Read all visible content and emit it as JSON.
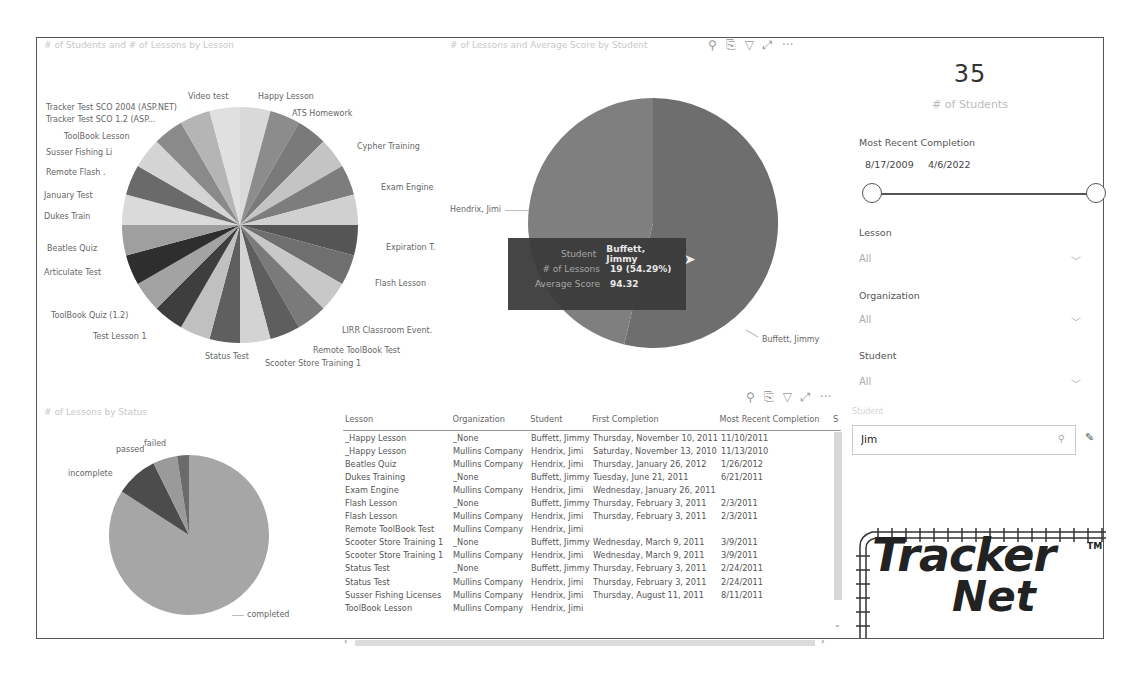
{
  "visuals": {
    "pie_lessons": {
      "title": "# of Students and # of Lessons by Lesson",
      "labels": [
        "Video test",
        "Happy Lesson",
        "ATS Homework",
        "Cypher Training",
        "Exam Engine",
        "Expiration T.",
        "Flash Lesson",
        "LIRR Classroom Event.",
        "Remote ToolBook Test",
        "Scooter Store Training 1",
        "Status Test",
        "Test Lesson 1",
        "ToolBook Quiz (1.2)",
        "Articulate Test",
        "Beatles Quiz",
        "Dukes Train",
        "January Test",
        "Remote Flash .",
        "Susser Fishing Li",
        "ToolBook Lesson",
        "Tracker Test SCO 1.2 (ASP...",
        "Tracker Test SCO 2004 (ASP.NET)"
      ]
    },
    "pie_students": {
      "title": "# of Lessons and Average Score by Student",
      "labels": [
        "Hendrix, Jimi",
        "Buffett, Jimmy"
      ]
    },
    "pie_status": {
      "title": "# of Lessons by Status",
      "labels": [
        "failed",
        "passed",
        "incomplete",
        "completed"
      ]
    },
    "tooltip": {
      "rows": [
        {
          "key": "Student",
          "value": "Buffett, Jimmy"
        },
        {
          "key": "# of Lessons",
          "value": "19 (54.29%)"
        },
        {
          "key": "Average Score",
          "value": "94.32"
        }
      ]
    },
    "toolbar_icons": [
      "pin-icon",
      "copy-icon",
      "filter-icon",
      "focus-mode-icon",
      "more-options-icon"
    ],
    "toolbar_glyphs": {
      "pin": "⚲",
      "copy": "⎘",
      "filter": "▽",
      "focus": "⤢",
      "more": "···"
    }
  },
  "card": {
    "value": "35",
    "label": "# of Students"
  },
  "slicers": {
    "date": {
      "title": "Most Recent Completion",
      "start": "8/17/2009",
      "end": "4/6/2022"
    },
    "lesson": {
      "title": "Lesson",
      "value": "All"
    },
    "organization": {
      "title": "Organization",
      "value": "All"
    },
    "student": {
      "title": "Student",
      "value": "All"
    },
    "search": {
      "label": "Student",
      "value": "Jim"
    }
  },
  "table": {
    "columns": [
      "Lesson",
      "Organization",
      "Student",
      "First Completion",
      "Most Recent Completion",
      "S"
    ],
    "rows": [
      [
        "_Happy Lesson",
        "_None",
        "Buffett, Jimmy",
        "Thursday, November 10, 2011",
        "11/10/2011"
      ],
      [
        "_Happy Lesson",
        "Mullins Company",
        "Hendrix, Jimi",
        "Saturday, November 13, 2010",
        "11/13/2010"
      ],
      [
        "Beatles Quiz",
        "Mullins Company",
        "Hendrix, Jimi",
        "Thursday, January 26, 2012",
        "1/26/2012"
      ],
      [
        "Dukes Training",
        "_None",
        "Buffett, Jimmy",
        "Tuesday, June 21, 2011",
        "6/21/2011"
      ],
      [
        "Exam Engine",
        "Mullins Company",
        "Hendrix, Jimi",
        "Wednesday, January 26, 2011",
        ""
      ],
      [
        "Flash Lesson",
        "_None",
        "Buffett, Jimmy",
        "Thursday, February 3, 2011",
        "2/3/2011"
      ],
      [
        "Flash Lesson",
        "Mullins Company",
        "Hendrix, Jimi",
        "Thursday, February 3, 2011",
        "2/3/2011"
      ],
      [
        "Remote ToolBook Test",
        "Mullins Company",
        "Hendrix, Jimi",
        "",
        ""
      ],
      [
        "Scooter Store Training 1",
        "_None",
        "Buffett, Jimmy",
        "Wednesday, March 9, 2011",
        "3/9/2011"
      ],
      [
        "Scooter Store Training 1",
        "Mullins Company",
        "Hendrix, Jimi",
        "Wednesday, March 9, 2011",
        "3/9/2011"
      ],
      [
        "Status Test",
        "_None",
        "Buffett, Jimmy",
        "Thursday, February 3, 2011",
        "2/24/2011"
      ],
      [
        "Status Test",
        "Mullins Company",
        "Hendrix, Jimi",
        "Thursday, February 3, 2011",
        "2/24/2011"
      ],
      [
        "Susser Fishing Licenses",
        "Mullins Company",
        "Hendrix, Jimi",
        "Thursday, August 11, 2011",
        "8/11/2011"
      ],
      [
        "ToolBook Lesson",
        "Mullins Company",
        "Hendrix, Jimi",
        "",
        ""
      ]
    ]
  },
  "logo": {
    "line1": "Tracker",
    "line2": "Net",
    "tm": "TM"
  }
}
